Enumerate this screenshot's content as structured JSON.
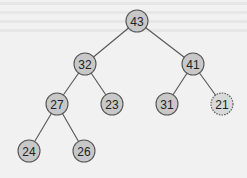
{
  "diagram": {
    "type": "binary-tree",
    "colors": {
      "background": "#f1f1f1",
      "node_fill": "#c8c8c8",
      "node_stroke": "#555555",
      "highlight_fill": "#d9d9d9",
      "edge": "#555555",
      "text": "#222222"
    },
    "node_radius": 11,
    "nodes": [
      {
        "id": "n43",
        "label": "43",
        "x": 137,
        "y": 21,
        "dotted": false
      },
      {
        "id": "n32",
        "label": "32",
        "x": 85,
        "y": 64,
        "dotted": false
      },
      {
        "id": "n41",
        "label": "41",
        "x": 193,
        "y": 64,
        "dotted": false
      },
      {
        "id": "n27",
        "label": "27",
        "x": 57,
        "y": 104,
        "dotted": false
      },
      {
        "id": "n23",
        "label": "23",
        "x": 112,
        "y": 104,
        "dotted": false
      },
      {
        "id": "n31",
        "label": "31",
        "x": 167,
        "y": 104,
        "dotted": false
      },
      {
        "id": "n21",
        "label": "21",
        "x": 222,
        "y": 104,
        "dotted": true
      },
      {
        "id": "n24",
        "label": "24",
        "x": 29,
        "y": 151,
        "dotted": false
      },
      {
        "id": "n26",
        "label": "26",
        "x": 84,
        "y": 151,
        "dotted": false
      }
    ],
    "edges": [
      [
        "n43",
        "n32"
      ],
      [
        "n43",
        "n41"
      ],
      [
        "n32",
        "n27"
      ],
      [
        "n32",
        "n23"
      ],
      [
        "n41",
        "n31"
      ],
      [
        "n41",
        "n21"
      ],
      [
        "n27",
        "n24"
      ],
      [
        "n27",
        "n26"
      ]
    ]
  }
}
